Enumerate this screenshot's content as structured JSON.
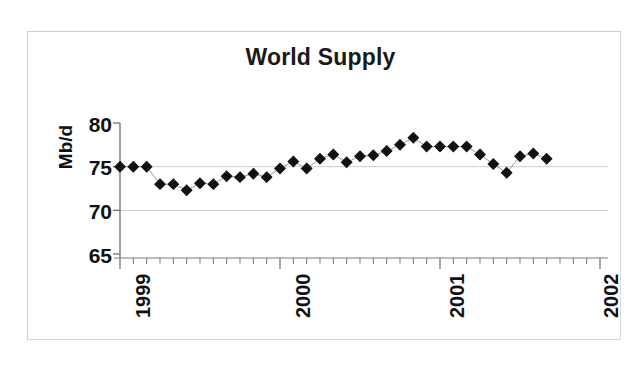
{
  "figure": {
    "title": "World Supply",
    "background_color": "#ffffff",
    "border_color": "#d9d9d9",
    "marker_color": "#111111",
    "line_color": "#8c8c8c",
    "grid_color": "#cccccc",
    "axis_color": "#7a7a7a"
  },
  "axes": {
    "ylabel": "Mb/d",
    "ytick_labels": [
      "80",
      "75",
      "70",
      "65"
    ],
    "xtick_labels": [
      "1999",
      "2000",
      "2001",
      "2002"
    ]
  },
  "chart_data": {
    "type": "scatter",
    "title": "World Supply",
    "xlabel": "",
    "ylabel": "Mb/d",
    "ylim": [
      65,
      80
    ],
    "yticks": [
      65,
      70,
      75,
      80
    ],
    "xlim": [
      "1999-01",
      "2002-01"
    ],
    "xticks": [
      "1999",
      "2000",
      "2001",
      "2002"
    ],
    "xtick_rotation": 90,
    "grid": "horizontal-only",
    "legend": "none",
    "marker": "filled-diamond",
    "series": [
      {
        "name": "World Supply",
        "units": "Mb/d",
        "x": [
          "1999-01",
          "1999-02",
          "1999-03",
          "1999-04",
          "1999-05",
          "1999-06",
          "1999-07",
          "1999-08",
          "1999-09",
          "1999-10",
          "1999-11",
          "1999-12",
          "2000-01",
          "2000-02",
          "2000-03",
          "2000-04",
          "2000-05",
          "2000-06",
          "2000-07",
          "2000-08",
          "2000-09",
          "2000-10",
          "2000-11",
          "2000-12",
          "2001-01",
          "2001-02",
          "2001-03",
          "2001-04",
          "2001-05",
          "2001-06",
          "2001-07",
          "2001-08",
          "2001-09"
        ],
        "values": [
          75.0,
          75.0,
          75.0,
          73.0,
          73.0,
          72.3,
          73.1,
          73.0,
          73.9,
          73.8,
          74.2,
          73.8,
          74.8,
          75.6,
          74.8,
          75.9,
          76.4,
          75.5,
          76.2,
          76.3,
          76.8,
          77.5,
          78.3,
          77.3,
          77.3,
          77.3,
          77.3,
          76.4,
          75.3,
          74.3,
          76.2,
          76.5,
          75.9
        ]
      }
    ]
  }
}
